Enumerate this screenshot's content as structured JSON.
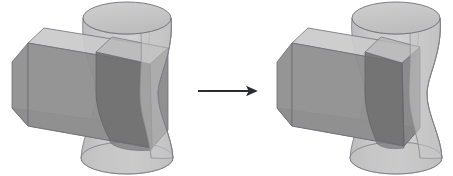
{
  "page": {
    "background_color": "#ffffff",
    "width": 453,
    "height": 176
  },
  "palette": {
    "edge_stroke": "#6f6f78",
    "edge_stroke_soft": "#8b8b93",
    "prism_top_face": "#c9c9c9",
    "prism_front_face": "#8e8e8e",
    "prism_side_face": "#7f7f7f",
    "prism_bottom_face": "#9a9a9a",
    "hyperboloid_body": "#c2c2c2",
    "hyperboloid_top_cap": "#c6c6c6",
    "hyperboloid_shadow": "#a9a9a9",
    "intersection_dark": "#6f6f6f",
    "intersection_mid": "#7c7c7c",
    "arrow_color": "#2b2b33"
  },
  "arrow": {
    "name": "transformation-arrow",
    "label": "",
    "direction": "right",
    "x_start": 198,
    "x_end": 259,
    "y": 91,
    "head_length": 11,
    "head_width": 9,
    "stroke_width": 2
  },
  "figures": [
    {
      "id": "figure-left",
      "name": "left-figure",
      "label": "",
      "role": "before",
      "origin_x": 0,
      "origin_y": 0,
      "description": "Triangular prism intersecting a hyperboloid of one sheet",
      "hyperboloid": {
        "name": "hyperboloid",
        "center_x": 127,
        "top_y": 18,
        "bottom_y": 158,
        "top_rx": 44,
        "top_ry": 16,
        "bottom_rx": 46,
        "bottom_ry": 16,
        "waist_rx": 31,
        "waist_y": 94
      },
      "prism": {
        "name": "triangular-prism",
        "apex_near_x": 28,
        "apex_near_y": 43,
        "apex_far_x": 150,
        "apex_far_y": 64,
        "front_bottom_y": 108,
        "left_x": 12,
        "right_x": 168,
        "height": 65
      }
    },
    {
      "id": "figure-right",
      "name": "right-figure",
      "label": "",
      "role": "after",
      "origin_x": 272,
      "origin_y": 0,
      "description": "Same hyperboloid with the prism shortened so it terminates at the solid intersection",
      "hyperboloid": {
        "name": "hyperboloid",
        "center_x": 396,
        "top_y": 18,
        "bottom_y": 158,
        "top_rx": 44,
        "top_ry": 16,
        "bottom_rx": 46,
        "bottom_ry": 16,
        "waist_rx": 31,
        "waist_y": 94
      },
      "prism": {
        "name": "triangular-prism",
        "apex_near_x": 285,
        "apex_near_y": 43,
        "apex_far_x": 400,
        "apex_far_y": 64,
        "front_bottom_y": 108,
        "left_x": 277,
        "right_x": 420,
        "height": 65
      }
    }
  ]
}
